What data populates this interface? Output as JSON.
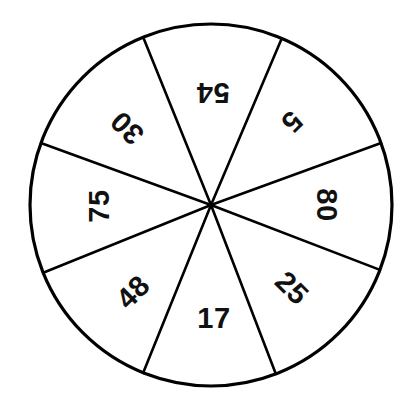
{
  "figure": {
    "name": "spinner-wheel",
    "type": "spinner",
    "background_color": "#ffffff",
    "stroke_color": "#000000",
    "fill_color": "#ffffff",
    "center": {
      "x": 211,
      "y": 205
    },
    "radius": 181,
    "sector_count": 8
  },
  "chart_data": {
    "type": "pie",
    "title": "",
    "xlabel": "",
    "ylabel": "",
    "legend": "none",
    "grid": false,
    "categories": [
      "54",
      "30",
      "75",
      "48",
      "17",
      "25",
      "80",
      "5"
    ],
    "values": [
      45,
      48,
      42,
      46,
      43,
      48,
      41,
      47
    ],
    "labels": [
      "54",
      "30",
      "75",
      "48",
      "17",
      "25",
      "80",
      "5"
    ],
    "sectors": [
      {
        "label": "54",
        "start_angle": 67,
        "end_angle": 112,
        "mid_angle": 89.5,
        "label_rotation": 180,
        "label_x": 213,
        "label_y": 93
      },
      {
        "label": "30",
        "start_angle": 112,
        "end_angle": 160,
        "mid_angle": 136,
        "label_rotation": 225,
        "label_x": 127,
        "label_y": 128
      },
      {
        "label": "75",
        "start_angle": 160,
        "end_angle": 202,
        "mid_angle": 181,
        "label_rotation": 270,
        "label_x": 99,
        "label_y": 206
      },
      {
        "label": "48",
        "start_angle": 202,
        "end_angle": 248,
        "mid_angle": 225,
        "label_rotation": 315,
        "label_x": 133,
        "label_y": 292
      },
      {
        "label": "17",
        "start_angle": 248,
        "end_angle": 291,
        "mid_angle": 269.5,
        "label_rotation": 0,
        "label_x": 214,
        "label_y": 318
      },
      {
        "label": "25",
        "start_angle": 291,
        "end_angle": 339,
        "mid_angle": 315,
        "label_rotation": 45,
        "label_x": 292,
        "label_y": 288
      },
      {
        "label": "80",
        "start_angle": 339,
        "end_angle": 20,
        "mid_angle": 359.5,
        "label_rotation": 90,
        "label_x": 327,
        "label_y": 205
      },
      {
        "label": "5",
        "start_angle": 20,
        "end_angle": 67,
        "mid_angle": 43.5,
        "label_rotation": 135,
        "label_x": 292,
        "label_y": 122
      }
    ]
  }
}
